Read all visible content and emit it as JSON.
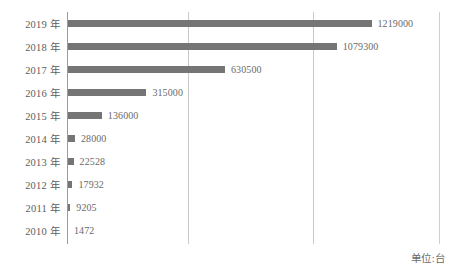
{
  "chart_data": {
    "type": "bar",
    "orientation": "horizontal",
    "title": "",
    "xlabel": "",
    "ylabel": "",
    "unit_note": "单位:台",
    "categories": [
      "2019 年",
      "2018 年",
      "2017 年",
      "2016 年",
      "2015 年",
      "2014 年",
      "2013 年",
      "2012 年",
      "2011 年",
      "2010 年"
    ],
    "values": [
      1219000,
      1079300,
      630500,
      315000,
      136000,
      28000,
      22528,
      17932,
      9205,
      1472
    ],
    "value_labels": [
      "1219000",
      "1079300",
      "630500",
      "315000",
      "136000",
      "28000",
      "22528",
      "17932",
      "9205",
      "1472"
    ],
    "xlim": [
      0,
      1500000
    ],
    "gridlines": [
      500000,
      1000000
    ],
    "grid": true,
    "legend": "none",
    "bar_color": "#757575",
    "gridline_color": "#c9c9c9",
    "axis_color": "#9a9a9a",
    "text_color": "#5d5d5d"
  }
}
